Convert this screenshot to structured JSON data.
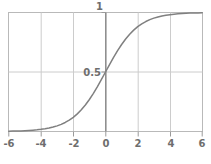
{
  "chart_data": {
    "type": "line",
    "title": "",
    "subtitle": "",
    "xlabel": "",
    "ylabel": "",
    "xlim": [
      -6,
      6
    ],
    "ylim": [
      0,
      1
    ],
    "grid": true,
    "legend": null,
    "legend_position": "none",
    "x_ticks": [
      -6,
      -4,
      -2,
      0,
      2,
      4,
      6
    ],
    "x_tick_labels": [
      "-6",
      "-4",
      "-2",
      "0",
      "2",
      "4",
      "6"
    ],
    "y_ticks": [
      0.5,
      1
    ],
    "y_tick_labels": [
      "0.5",
      "1"
    ],
    "series": [
      {
        "name": "sigmoid",
        "color": "#808080",
        "formula": "1 / (1 + exp(-x))",
        "x": [
          -6,
          -5.75,
          -5.5,
          -5.25,
          -5,
          -4.75,
          -4.5,
          -4.25,
          -4,
          -3.75,
          -3.5,
          -3.25,
          -3,
          -2.75,
          -2.5,
          -2.25,
          -2,
          -1.75,
          -1.5,
          -1.25,
          -1,
          -0.75,
          -0.5,
          -0.25,
          0,
          0.25,
          0.5,
          0.75,
          1,
          1.25,
          1.5,
          1.75,
          2,
          2.25,
          2.5,
          2.75,
          3,
          3.25,
          3.5,
          3.75,
          4,
          4.25,
          4.5,
          4.75,
          5,
          5.25,
          5.5,
          5.75,
          6
        ],
        "y": [
          0.0025,
          0.0032,
          0.0041,
          0.0052,
          0.0067,
          0.0086,
          0.011,
          0.014,
          0.018,
          0.023,
          0.0293,
          0.0373,
          0.0474,
          0.0601,
          0.0759,
          0.0953,
          0.1192,
          0.148,
          0.1824,
          0.2227,
          0.2689,
          0.3208,
          0.3775,
          0.4378,
          0.5,
          0.5622,
          0.6225,
          0.6792,
          0.7311,
          0.7773,
          0.8176,
          0.852,
          0.8808,
          0.9047,
          0.9241,
          0.9399,
          0.9526,
          0.9627,
          0.9707,
          0.977,
          0.982,
          0.986,
          0.989,
          0.9914,
          0.9933,
          0.9948,
          0.9959,
          0.9968,
          0.9975
        ]
      }
    ],
    "annotations": [],
    "axis_highlight": {
      "name": "y-axis-zero-line",
      "x": 0,
      "color": "#8c8c8c"
    },
    "colors": {
      "curve": "#8a8a8a",
      "gridline": "#c8c8c8",
      "frame": "#b4b4b4",
      "axis_emphasis": "#8c8c8c",
      "tick_label": "#6e6e6e",
      "background": "#ffffff"
    }
  }
}
